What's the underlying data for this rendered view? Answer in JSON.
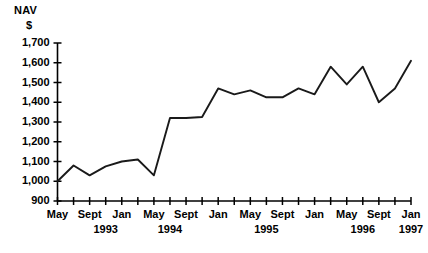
{
  "chart_data": {
    "type": "line",
    "title": "",
    "subtitle": "",
    "ylabel_lines": [
      "NAV",
      "$"
    ],
    "xlabel": "",
    "ylim": [
      900,
      1700
    ],
    "ytick_labels": [
      "1,700",
      "1,600",
      "1,500",
      "1,400",
      "1,300",
      "1,200",
      "1,100",
      "1,000",
      "900"
    ],
    "ytick_values": [
      1700,
      1600,
      1500,
      1400,
      1300,
      1200,
      1100,
      1000,
      900
    ],
    "grid": false,
    "legend": "none",
    "series_color": "#1a1a1a",
    "axis_color": "#000000",
    "xtick_labels": [
      {
        "text": "May",
        "index": 0
      },
      {
        "text": "Sept",
        "index": 2
      },
      {
        "text": "Jan",
        "index": 4
      },
      {
        "text": "May",
        "index": 6
      },
      {
        "text": "Sept",
        "index": 8
      },
      {
        "text": "Jan",
        "index": 10
      },
      {
        "text": "May",
        "index": 12
      },
      {
        "text": "Sept",
        "index": 14
      },
      {
        "text": "Jan",
        "index": 16
      },
      {
        "text": "May",
        "index": 18
      },
      {
        "text": "Sept",
        "index": 20
      },
      {
        "text": "Jan",
        "index": 22
      }
    ],
    "xyear_labels": [
      {
        "text": "1993",
        "index": 3
      },
      {
        "text": "1994",
        "index": 7
      },
      {
        "text": "1995",
        "index": 13
      },
      {
        "text": "1996",
        "index": 19
      },
      {
        "text": "1997",
        "index": 22
      }
    ],
    "x": [
      "May 1993",
      "Jul 1993",
      "Sept 1993",
      "Nov 1993",
      "Jan 1994",
      "Mar 1994",
      "May 1994",
      "Jul 1994",
      "Sept 1994",
      "Nov 1994",
      "Jan 1995",
      "Mar 1995",
      "May 1995",
      "Jul 1995",
      "Sept 1995",
      "Nov 1995",
      "Jan 1996",
      "Mar 1996",
      "May 1996",
      "Jul 1996",
      "Sept 1996",
      "Nov 1996",
      "Jan 1997"
    ],
    "values": [
      1000,
      1080,
      1030,
      1075,
      1100,
      1110,
      1030,
      1320,
      1320,
      1325,
      1470,
      1440,
      1460,
      1425,
      1425,
      1470,
      1440,
      1580,
      1490,
      1580,
      1400,
      1470,
      1610
    ]
  }
}
